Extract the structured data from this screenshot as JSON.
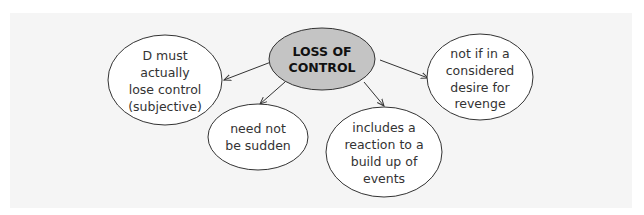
{
  "diagram": {
    "colors": {
      "background": "#f5f5f5",
      "center_fill": "#c4c4c4",
      "node_fill": "#ffffff",
      "stroke": "#333333"
    },
    "center": {
      "lines": [
        "LOSS OF",
        "CONTROL"
      ]
    },
    "nodes": [
      {
        "id": "left",
        "lines": [
          "D must",
          "actually",
          "lose control",
          "(subjective)"
        ]
      },
      {
        "id": "bottom-left",
        "lines": [
          "need not",
          "be sudden"
        ]
      },
      {
        "id": "bottom-right",
        "lines": [
          "includes a",
          "reaction to a",
          "build up of",
          "events"
        ]
      },
      {
        "id": "right",
        "lines": [
          "not if in a",
          "considered",
          "desire for",
          "revenge"
        ]
      }
    ]
  }
}
